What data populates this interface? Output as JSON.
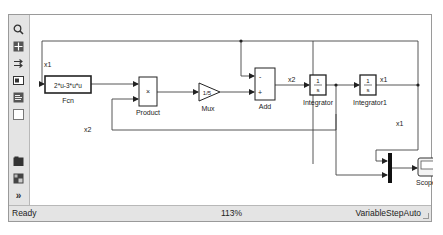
{
  "window": {
    "toolbar": {
      "icons": [
        "zoom-icon",
        "fit-to-view-icon",
        "arrows-icon",
        "image-icon",
        "text-icon",
        "square-icon",
        "folder-icon",
        "library-icon",
        "more-icon"
      ],
      "more_glyph": "»"
    },
    "diagram": {
      "blocks": {
        "fcn": {
          "expression": "2*u-3*u*u",
          "label": "Fcn"
        },
        "product": {
          "symbol": "×",
          "label": "Product"
        },
        "gain": {
          "value": "1/5",
          "label": "Mux"
        },
        "add": {
          "sign_top": "-",
          "sign_bottom": "+",
          "label": "Add"
        },
        "integrator": {
          "numerator": "1",
          "denominator": "s",
          "label": "Integrator"
        },
        "integrator1": {
          "numerator": "1",
          "denominator": "s",
          "label": "Integrator1"
        },
        "mux": {
          "label": ""
        },
        "scope": {
          "label": "Scope"
        }
      },
      "signals": {
        "x1_feedback": "x1",
        "x2_feedback": "x2",
        "x2_add_out": "x2",
        "x1_out": "x1",
        "x1_down": "x1"
      }
    },
    "status": {
      "state": "Ready",
      "zoom": "113%",
      "solver": "VariableStepAuto"
    }
  },
  "colors": {
    "toolbar_bg": "#e4e4e4",
    "line": "#444444",
    "block_border": "#333333"
  }
}
